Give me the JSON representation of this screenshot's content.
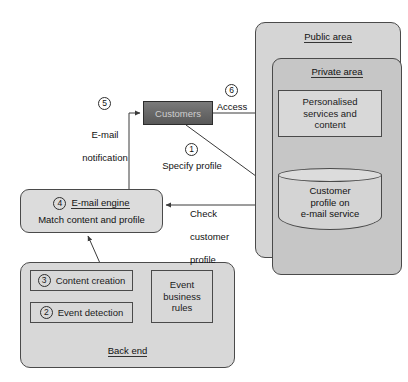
{
  "diagram": {
    "colors": {
      "public_area_fill": "#d5d5d5",
      "private_area_fill": "#c6c6c6",
      "node_fill": "#dcdcdc",
      "customers_fill": "#6a6a6a",
      "customers_text": "#cfcfcf",
      "stroke": "#4a4a4a",
      "text": "#111111"
    }
  },
  "zones": {
    "public_area": {
      "label": "Public area"
    },
    "private_area": {
      "label": "Private area"
    },
    "back_end": {
      "label": "Back end"
    }
  },
  "nodes": {
    "customers": {
      "label": "Customers"
    },
    "personalised": {
      "line1": "Personalised",
      "line2": "services and",
      "line3": "content"
    },
    "customer_profile_db": {
      "line1": "Customer",
      "line2": "profile on",
      "line3": "e-mail service"
    },
    "email_engine": {
      "step": "4",
      "title": "E-mail engine",
      "subtitle": "Match content and profile"
    },
    "content_creation": {
      "step": "3",
      "label": "Content creation"
    },
    "event_detection": {
      "step": "2",
      "label": "Event detection"
    },
    "event_business_rules": {
      "line1": "Event",
      "line2": "business",
      "line3": "rules"
    }
  },
  "edges": {
    "specify_profile": {
      "step": "1",
      "label": "Specify profile"
    },
    "email_notification": {
      "step": "5",
      "line1": "E-mail",
      "line2": "notification"
    },
    "access": {
      "step": "6",
      "label": "Access"
    },
    "check_customer_profile": {
      "line1": "Check",
      "line2": "customer",
      "line3": "profile"
    }
  }
}
